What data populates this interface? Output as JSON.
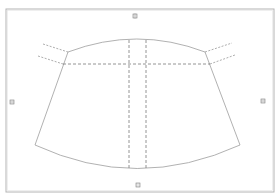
{
  "diagram": {
    "type": "pattern-piece",
    "colors": {
      "background": "#ffffff",
      "frame": "#b4b4b4",
      "frame_inner": "#dcdcdc",
      "outline": "#a8a8a8",
      "dashed": "#7a7a7a",
      "marker_fill": "#e6e6e6",
      "marker_stroke": "#7f7f7f"
    },
    "frame": {
      "x": 6,
      "y": 9,
      "width": 268,
      "height": 183
    },
    "markers": [
      {
        "name": "top",
        "x": 135,
        "y": 16
      },
      {
        "name": "bottom",
        "x": 138,
        "y": 185
      },
      {
        "name": "left",
        "x": 12,
        "y": 102
      },
      {
        "name": "right",
        "x": 263,
        "y": 101
      }
    ],
    "shape": {
      "top_left": [
        68,
        52
      ],
      "top_right": [
        205,
        52
      ],
      "bottom_left": [
        35,
        145
      ],
      "bottom_right": [
        240,
        145
      ],
      "top_arc_peak_y": 38,
      "bottom_arc_low_y": 169
    },
    "guides": {
      "horizontal_y": 64,
      "horizontal_x_range": [
        63,
        210
      ],
      "vertical_x": [
        129,
        146
      ],
      "vertical_y_range": [
        40,
        168
      ],
      "extensions": [
        {
          "name": "upper-left",
          "from": [
            43,
            44
          ],
          "to": [
            68,
            52
          ]
        },
        {
          "name": "lower-left",
          "from": [
            38,
            56
          ],
          "to": [
            63,
            64
          ]
        },
        {
          "name": "upper-right",
          "from": [
            205,
            52
          ],
          "to": [
            232,
            43
          ]
        },
        {
          "name": "lower-right",
          "from": [
            210,
            64
          ],
          "to": [
            235,
            55
          ]
        }
      ]
    }
  }
}
